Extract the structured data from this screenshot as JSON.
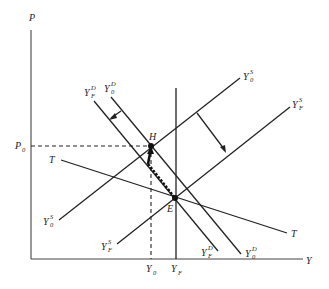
{
  "diagram": {
    "type": "economics-aggregate-supply-demand",
    "axes": {
      "y_label": "P",
      "x_label": "Y"
    },
    "price_marks": [
      {
        "main": "P",
        "sub": "0"
      }
    ],
    "output_marks": [
      {
        "main": "Y",
        "sub": "0"
      },
      {
        "main": "Y",
        "sub": "F"
      }
    ],
    "curves": {
      "Y0S": {
        "main": "Y",
        "sup": "S",
        "sub": "0"
      },
      "YFS": {
        "main": "Y",
        "sup": "S",
        "sub": "F"
      },
      "Y0D": {
        "main": "Y",
        "sup": "D",
        "sub": "0"
      },
      "YFD": {
        "main": "Y",
        "sup": "D",
        "sub": "F"
      },
      "T": {
        "main": "T"
      }
    },
    "points": {
      "H": "H",
      "E": "E"
    }
  }
}
